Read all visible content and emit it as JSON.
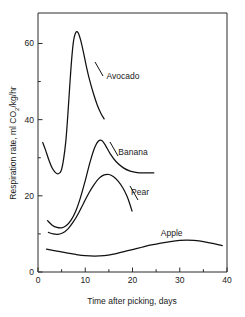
{
  "chart_data": {
    "type": "line",
    "title": "",
    "xlabel": "Time after picking, days",
    "ylabel": "Respiration rate, ml CO2/kg/hr",
    "ylabel_parts": {
      "prefix": "Respiration rate, ml CO",
      "subscript": "2",
      "suffix": "/kg/hr"
    },
    "xlim": [
      0,
      40
    ],
    "ylim": [
      0,
      68
    ],
    "grid": false,
    "legend_position": "inline-annotations",
    "x_major_ticks": [
      0,
      10,
      20,
      30,
      40
    ],
    "x_major_tick_labels": [
      "0",
      "10",
      "20",
      "30",
      "40"
    ],
    "x_minor_ticks": [
      5,
      15,
      25,
      35
    ],
    "y_major_ticks": [
      0,
      20,
      40,
      60
    ],
    "y_major_tick_labels": [
      "0",
      "20",
      "40",
      "60"
    ],
    "y_minor_ticks": [
      10,
      30,
      50
    ],
    "series": [
      {
        "name": "Avocado",
        "label": "Avocado",
        "label_x": 14.5,
        "label_y": 51.5,
        "points": [
          [
            1.0,
            34.0
          ],
          [
            1.6,
            32.0
          ],
          [
            2.3,
            29.4
          ],
          [
            3.0,
            27.3
          ],
          [
            3.7,
            26.1
          ],
          [
            4.3,
            25.8
          ],
          [
            4.9,
            26.6
          ],
          [
            5.4,
            29.5
          ],
          [
            5.9,
            34.5
          ],
          [
            6.3,
            41.0
          ],
          [
            6.7,
            48.5
          ],
          [
            7.1,
            55.5
          ],
          [
            7.5,
            60.5
          ],
          [
            8.0,
            62.9
          ],
          [
            8.5,
            62.8
          ],
          [
            9.0,
            61.0
          ],
          [
            9.6,
            57.8
          ],
          [
            10.2,
            54.2
          ],
          [
            10.9,
            50.5
          ],
          [
            11.7,
            47.0
          ],
          [
            12.5,
            44.0
          ],
          [
            13.3,
            41.7
          ],
          [
            14.0,
            40.2
          ]
        ]
      },
      {
        "name": "Banana",
        "label": "Banana",
        "label_x": 17.0,
        "label_y": 31.5,
        "points": [
          [
            2.0,
            13.5
          ],
          [
            3.0,
            12.3
          ],
          [
            4.0,
            11.7
          ],
          [
            5.0,
            11.6
          ],
          [
            6.0,
            12.2
          ],
          [
            7.0,
            13.6
          ],
          [
            8.0,
            16.0
          ],
          [
            9.0,
            19.6
          ],
          [
            10.0,
            24.0
          ],
          [
            11.0,
            28.8
          ],
          [
            12.0,
            32.7
          ],
          [
            12.8,
            34.4
          ],
          [
            13.5,
            34.5
          ],
          [
            14.3,
            33.2
          ],
          [
            15.3,
            31.0
          ],
          [
            16.5,
            29.0
          ],
          [
            18.0,
            27.4
          ],
          [
            19.5,
            26.5
          ],
          [
            21.0,
            26.1
          ],
          [
            22.5,
            26.0
          ],
          [
            24.5,
            26.0
          ]
        ]
      },
      {
        "name": "Pear",
        "label": "Pear",
        "label_x": 19.7,
        "label_y": 21.0,
        "points": [
          [
            2.2,
            10.4
          ],
          [
            3.2,
            10.0
          ],
          [
            4.2,
            9.9
          ],
          [
            5.3,
            10.3
          ],
          [
            6.4,
            11.4
          ],
          [
            7.5,
            13.2
          ],
          [
            8.6,
            15.5
          ],
          [
            9.7,
            18.2
          ],
          [
            10.8,
            20.8
          ],
          [
            11.9,
            23.0
          ],
          [
            13.0,
            24.7
          ],
          [
            14.0,
            25.5
          ],
          [
            15.0,
            25.6
          ],
          [
            16.0,
            25.0
          ],
          [
            17.0,
            23.8
          ],
          [
            18.0,
            22.0
          ],
          [
            18.8,
            20.0
          ],
          [
            19.4,
            18.0
          ],
          [
            19.9,
            16.0
          ]
        ]
      },
      {
        "name": "Apple",
        "label": "Apple",
        "label_x": 26.0,
        "label_y": 10.3,
        "points": [
          [
            1.8,
            6.0
          ],
          [
            4.0,
            5.5
          ],
          [
            6.0,
            5.0
          ],
          [
            8.0,
            4.6
          ],
          [
            10.0,
            4.3
          ],
          [
            12.0,
            4.2
          ],
          [
            14.0,
            4.3
          ],
          [
            16.0,
            4.7
          ],
          [
            18.0,
            5.3
          ],
          [
            20.0,
            5.9
          ],
          [
            22.0,
            6.5
          ],
          [
            24.0,
            7.1
          ],
          [
            26.0,
            7.6
          ],
          [
            28.0,
            8.0
          ],
          [
            30.0,
            8.3
          ],
          [
            31.5,
            8.4
          ],
          [
            33.0,
            8.3
          ],
          [
            35.0,
            8.0
          ],
          [
            37.0,
            7.5
          ],
          [
            39.0,
            6.9
          ]
        ]
      }
    ],
    "annotations": [
      {
        "text": "Avocado",
        "series": "Avocado"
      },
      {
        "text": "Banana",
        "series": "Banana"
      },
      {
        "text": "Pear",
        "series": "Pear"
      },
      {
        "text": "Apple",
        "series": "Apple"
      }
    ]
  }
}
